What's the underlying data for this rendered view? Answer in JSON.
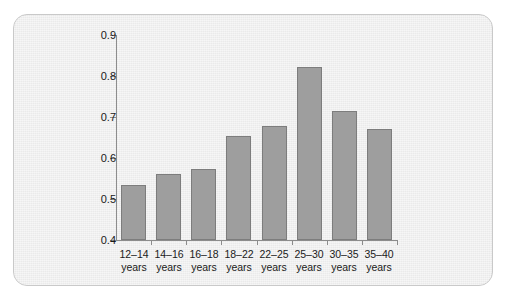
{
  "chart_data": {
    "type": "bar",
    "title": "",
    "subtitle": "",
    "xlabel": "",
    "ylabel": "",
    "categories": [
      "12–14 years",
      "14–16 years",
      "16–18 years",
      "18–22 years",
      "22–25 years",
      "25–30 years",
      "30–35 years",
      "35–40 years"
    ],
    "category_lines": [
      [
        "12–14",
        "years"
      ],
      [
        "14–16",
        "years"
      ],
      [
        "16–18",
        "years"
      ],
      [
        "18–22",
        "years"
      ],
      [
        "22–25",
        "years"
      ],
      [
        "25–30",
        "years"
      ],
      [
        "30–35",
        "years"
      ],
      [
        "35–40",
        "years"
      ]
    ],
    "values": [
      0.533,
      0.56,
      0.572,
      0.653,
      0.677,
      0.822,
      0.715,
      0.67
    ],
    "ylim": [
      0.4,
      0.9
    ],
    "ytick_labels": [
      "0.9",
      "0.8",
      "0.7",
      "0.6",
      "0.5",
      "0.4"
    ],
    "ytick_values": [
      0.9,
      0.8,
      0.7,
      0.6,
      0.5,
      0.4
    ],
    "grid": false,
    "legend": "none",
    "bar_color": "#9e9e9e",
    "bar_border_color": "#7d7d7d",
    "axis_color": "#8c8c8c",
    "background_color": "#ededed",
    "text_color": "#1a1a1a"
  }
}
